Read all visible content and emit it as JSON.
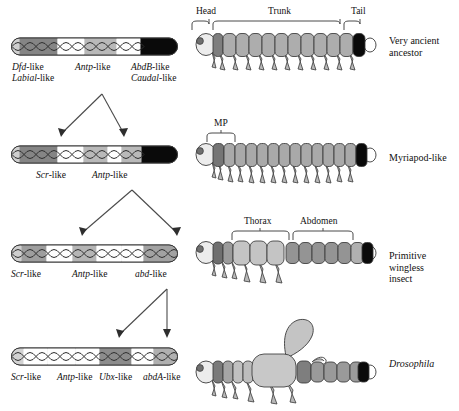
{
  "figure": {
    "type": "diagram"
  },
  "colors": {
    "light_grey": "#d9d9d9",
    "mid_light_grey": "#c3c3c3",
    "mid_grey": "#a8a8a8",
    "dark_grey": "#8a8a8a",
    "darker_grey": "#6f6f6f",
    "black": "#0a0a0a",
    "outline": "#3a3a3a",
    "white": "#ffffff",
    "arrow": "#4a4a4a"
  },
  "rows": [
    {
      "id": "row-ancestor",
      "organism_label": "Very ancient\nancestor",
      "organism_italic": false,
      "gene_labels": [
        {
          "italic": "Dfd",
          "roman": "-like",
          "second_line": "Labial-like"
        },
        {
          "italic": "Antp",
          "roman": "-like",
          "second_line": ""
        },
        {
          "italic": "AbdB",
          "roman": "-like",
          "second_line": "Caudal-like"
        }
      ],
      "body_regions": [
        "Head",
        "Trunk",
        "Tail"
      ],
      "segment_count": 12
    },
    {
      "id": "row-myriapod",
      "organism_label": "Myriapod-like",
      "organism_italic": false,
      "gene_labels": [
        {
          "italic": "Scr",
          "roman": "-like",
          "second_line": ""
        },
        {
          "italic": "Antp",
          "roman": "-like",
          "second_line": ""
        }
      ],
      "body_regions": [
        "MP"
      ],
      "segment_count": 14
    },
    {
      "id": "row-primitive-insect",
      "organism_label": "Primitive\nwingless\ninsect",
      "organism_italic": false,
      "gene_labels": [
        {
          "italic": "Scr",
          "roman": "-like",
          "second_line": ""
        },
        {
          "italic": "Antp",
          "roman": "-like",
          "second_line": ""
        },
        {
          "italic": "abd",
          "roman": "-like",
          "second_line": ""
        }
      ],
      "body_regions": [
        "Thorax",
        "Abdomen"
      ],
      "segment_count": 11
    },
    {
      "id": "row-drosophila",
      "organism_label": "Drosophila",
      "organism_italic": true,
      "gene_labels": [
        {
          "italic": "Scr",
          "roman": "-like",
          "second_line": ""
        },
        {
          "italic": "Antp",
          "roman": "-",
          "second_line": "like"
        },
        {
          "italic": "Ubx",
          "roman": "-",
          "second_line": "like"
        },
        {
          "italic": "abdA",
          "roman": "-",
          "second_line": "like"
        }
      ],
      "body_regions": [],
      "segment_count": 9
    }
  ],
  "gene_label_text": {
    "dfd_like": "Dfd-like",
    "labial_like": "Labial-like",
    "antp_like": "Antp-like",
    "abdb_like": "AbdB-like",
    "caudal_like": "Caudal-like",
    "scr_like": "Scr-like",
    "abd_like": "abd-like",
    "ubx_like": "Ubx-like",
    "abda_like": "abdA-like",
    "like_suffix": "like",
    "dash": "-"
  },
  "region_labels": {
    "head": "Head",
    "trunk": "Trunk",
    "tail": "Tail",
    "mp": "MP",
    "thorax": "Thorax",
    "abdomen": "Abdomen"
  },
  "organism_labels": {
    "ancestor": "Very ancient\nancestor",
    "myriapod": "Myriapod-like",
    "primitive_insect": "Primitive\nwingless\ninsect",
    "drosophila": "Drosophila"
  }
}
